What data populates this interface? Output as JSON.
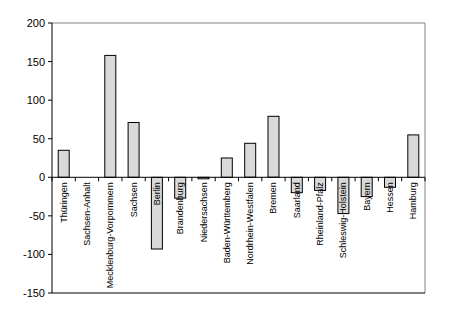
{
  "chart_data": {
    "type": "bar",
    "title": "",
    "xlabel": "",
    "ylabel": "",
    "ylim": [
      -150,
      200
    ],
    "yticks": [
      200,
      150,
      100,
      50,
      0,
      -50,
      -100,
      -150
    ],
    "grid": false,
    "legend": null,
    "categories": [
      "Thüringen",
      "Sachsen-Anhalt",
      "Mecklenburg-Vorpommern",
      "Sachsen",
      "Berlin",
      "Brandenburg",
      "Niedersachsen",
      "Baden-Württemberg",
      "Nordrhein-Westfalen",
      "Bremen",
      "Saarland",
      "Rheinland-Pfalz",
      "Schleswig-Holstein",
      "Bayern",
      "Hessen",
      "Hamburg"
    ],
    "values": [
      35,
      0,
      158,
      71,
      -93,
      -27,
      -2,
      25,
      44,
      79,
      -20,
      -17,
      -47,
      -25,
      -13,
      55
    ],
    "colors": {
      "bar_fill": "#d9d9d9",
      "bar_stroke": "#000000",
      "axis": "#000000"
    }
  }
}
